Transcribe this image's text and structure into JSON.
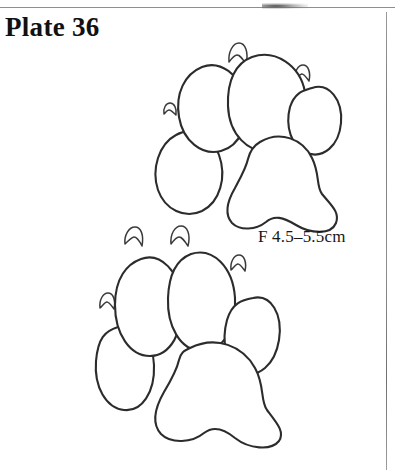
{
  "page": {
    "background_color": "#ffffff",
    "width": 395,
    "height": 470
  },
  "header": {
    "plate_title": "Plate 36"
  },
  "caption": {
    "size_label": "F 4.5–5.5cm"
  },
  "rules": {
    "top_rule_color": "#8e8e8e",
    "right_rule_color": "#7c7c7c"
  },
  "figure": {
    "kind": "animal-track-illustration",
    "ink_color": "#2c2c2c",
    "shading_color": "#9a9a9a",
    "prints": [
      {
        "name": "upper-paw-print",
        "toe_pad_count": 4,
        "claw_mark_count": 4,
        "palm_pad_count": 1
      },
      {
        "name": "lower-paw-print",
        "toe_pad_count": 4,
        "claw_mark_count": 4,
        "palm_pad_count": 1
      }
    ]
  }
}
